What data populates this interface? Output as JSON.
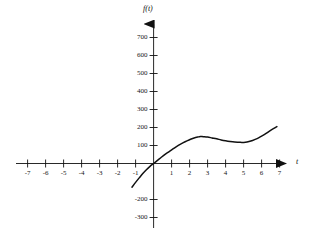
{
  "chart_data": {
    "type": "line",
    "title": "",
    "subtitle": "",
    "xlabel": "t",
    "ylabel": "f(t)",
    "xlim": [
      -7.6,
      7.6
    ],
    "ylim": [
      -340,
      760
    ],
    "grid": false,
    "legend": null,
    "x_ticks": [
      -7,
      -6,
      -5,
      -4,
      -3,
      -2,
      -1,
      1,
      2,
      3,
      4,
      5,
      6,
      7
    ],
    "x_tick_labels": [
      "-7",
      "-6",
      "-5",
      "-4",
      "-3",
      "-2",
      "-1",
      "1",
      "2",
      "3",
      "4",
      "5",
      "6",
      "7"
    ],
    "y_ticks": [
      700,
      600,
      500,
      400,
      300,
      200,
      100,
      -200,
      -300
    ],
    "y_tick_labels": [
      "700",
      "600",
      "500",
      "400",
      "300",
      "200",
      "100",
      "-200",
      "-300"
    ],
    "axes_style": "arrowed-cartesian",
    "series": [
      {
        "name": "f(t)",
        "color": "#111111",
        "domain": [
          -1.2,
          6.85
        ],
        "points": [
          {
            "x": -1.2,
            "y": -132
          },
          {
            "x": -1.0,
            "y": -105
          },
          {
            "x": -0.8,
            "y": -80
          },
          {
            "x": -0.6,
            "y": -56
          },
          {
            "x": -0.4,
            "y": -35
          },
          {
            "x": -0.2,
            "y": -16
          },
          {
            "x": 0.0,
            "y": 0
          },
          {
            "x": 0.2,
            "y": 16
          },
          {
            "x": 0.4,
            "y": 32
          },
          {
            "x": 0.6,
            "y": 48
          },
          {
            "x": 0.8,
            "y": 62
          },
          {
            "x": 1.0,
            "y": 76
          },
          {
            "x": 1.25,
            "y": 93
          },
          {
            "x": 1.5,
            "y": 108
          },
          {
            "x": 1.75,
            "y": 121
          },
          {
            "x": 2.0,
            "y": 132
          },
          {
            "x": 2.25,
            "y": 142
          },
          {
            "x": 2.5,
            "y": 148
          },
          {
            "x": 2.6,
            "y": 150
          },
          {
            "x": 2.75,
            "y": 149
          },
          {
            "x": 3.0,
            "y": 147
          },
          {
            "x": 3.25,
            "y": 142
          },
          {
            "x": 3.5,
            "y": 137
          },
          {
            "x": 3.75,
            "y": 131
          },
          {
            "x": 4.0,
            "y": 126
          },
          {
            "x": 4.25,
            "y": 122
          },
          {
            "x": 4.5,
            "y": 119
          },
          {
            "x": 4.75,
            "y": 118
          },
          {
            "x": 4.9,
            "y": 117
          },
          {
            "x": 5.1,
            "y": 118
          },
          {
            "x": 5.3,
            "y": 122
          },
          {
            "x": 5.5,
            "y": 128
          },
          {
            "x": 5.75,
            "y": 138
          },
          {
            "x": 6.0,
            "y": 152
          },
          {
            "x": 6.25,
            "y": 167
          },
          {
            "x": 6.5,
            "y": 184
          },
          {
            "x": 6.85,
            "y": 205
          }
        ],
        "features": {
          "local_max": {
            "x": 2.6,
            "y": 150
          },
          "local_min": {
            "x": 4.9,
            "y": 117
          },
          "root": {
            "x": 0,
            "y": 0
          }
        }
      }
    ]
  },
  "axis_labels": {
    "y_axis_name": "f(t)",
    "x_axis_name": "t"
  }
}
